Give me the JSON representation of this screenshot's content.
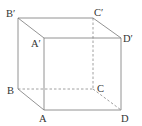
{
  "diagram": {
    "type": "cube",
    "vertices": {
      "B_prime": {
        "label": "B′",
        "x": 18,
        "y": 18
      },
      "C_prime": {
        "label": "C′",
        "x": 93,
        "y": 18
      },
      "A_prime": {
        "label": "A′",
        "x": 44,
        "y": 38
      },
      "D_prime": {
        "label": "D′",
        "x": 121,
        "y": 38
      },
      "B": {
        "label": "B",
        "x": 18,
        "y": 89
      },
      "C": {
        "label": "C",
        "x": 93,
        "y": 89
      },
      "A": {
        "label": "A",
        "x": 44,
        "y": 110
      },
      "D": {
        "label": "D",
        "x": 121,
        "y": 110
      }
    },
    "solid_edges": [
      [
        "B′",
        "C′"
      ],
      [
        "B′",
        "A′"
      ],
      [
        "A′",
        "D′"
      ],
      [
        "C′",
        "D′"
      ],
      [
        "B′",
        "B"
      ],
      [
        "A′",
        "A"
      ],
      [
        "D′",
        "D"
      ],
      [
        "B",
        "A"
      ],
      [
        "A",
        "D"
      ]
    ],
    "hidden_edges": [
      [
        "B",
        "C"
      ],
      [
        "C",
        "D"
      ],
      [
        "C′",
        "C"
      ]
    ]
  }
}
